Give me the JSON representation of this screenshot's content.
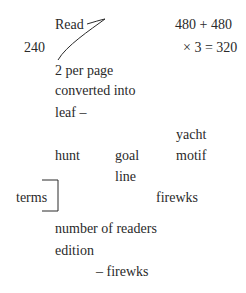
{
  "notes": {
    "read": "Read",
    "count_left": "240",
    "sum_line": "480 + 480",
    "mult_line": "× 3 = 320",
    "per_page": "2 per page",
    "converted": "converted into",
    "leaf": "leaf –",
    "yacht": "yacht",
    "hunt": "hunt",
    "goal": "goal",
    "motif": "motif",
    "line": "line",
    "terms": "terms",
    "firewks_1": "firewks",
    "readers": "number of readers",
    "edition": "edition",
    "firewks_2": "– firewks"
  },
  "colors": {
    "ink": "#2a2a2a",
    "background": "#ffffff"
  }
}
